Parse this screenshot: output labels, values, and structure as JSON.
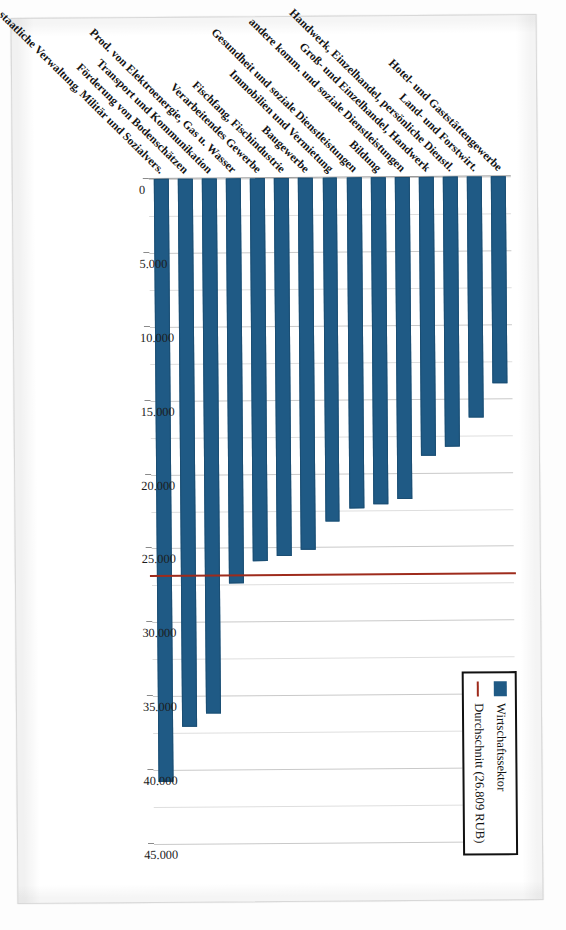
{
  "legend": {
    "position": "top-right",
    "items": [
      {
        "label": "Wirtschaftssektor",
        "marker": "bar",
        "color": "#1F5A85"
      },
      {
        "label": "Durchschnitt (26.809 RUB)",
        "marker": "line",
        "color": "#9E2B1C"
      }
    ]
  },
  "axis": {
    "tick_labels": [
      "0",
      "5.000",
      "10.000",
      "15.000",
      "20.000",
      "25.000",
      "30.000",
      "35.000",
      "40.000",
      "45.000"
    ]
  },
  "chart_data": {
    "type": "bar",
    "orientation": "horizontal",
    "title": "",
    "xlabel": "",
    "ylabel": "",
    "xlim": [
      0,
      45000
    ],
    "grid": true,
    "legend_position": "top-right",
    "average_label": "Durchschnitt (26.809 RUB)",
    "average_value": 26809,
    "series_name": "Wirtschaftssektor",
    "bar_color": "#1F5A85",
    "average_line_color": "#9E2B1C",
    "categories": [
      "Hotel- und Gaststättengewerbe",
      "Land- und Forstwirt.",
      "Handwerk, Einzelhandel, persönliche Dienstl.",
      "Groß- und Einzelhandel, Handwerk",
      "andere komm. und soziale Dienstleistungen",
      "Bildung",
      "Gesundheit und soziale Dienstleistungen",
      "Immobilien und Vermietung",
      "Baugewerbe",
      "Fischfang, Fischindustrie",
      "Verarbeitendes Gewerbe",
      "Prod. von Elektroenergie, Gas u. Wasser",
      "Transport und Kommunikation",
      "Förderung von Bodenschätzen",
      "staatliche Verwaltung, Militär und Sozialvers."
    ],
    "values": [
      14000,
      16300,
      18300,
      18900,
      21800,
      22100,
      22400,
      23300,
      25200,
      25600,
      25900,
      27400,
      36200,
      37100,
      40800
    ]
  }
}
